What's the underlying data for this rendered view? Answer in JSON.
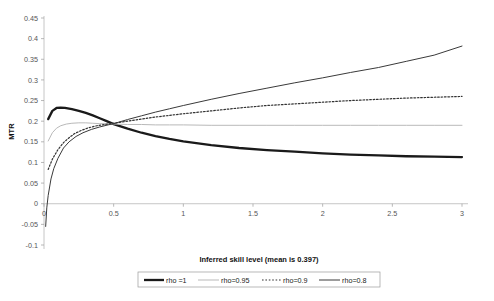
{
  "chart_data": {
    "type": "line",
    "title": "",
    "xlabel": "Inferred skill level (mean is 0.397)",
    "ylabel": "MTR",
    "xlim": [
      0,
      3
    ],
    "ylim": [
      -0.1,
      0.45
    ],
    "grid": false,
    "legend_position": "bottom",
    "xticks": [
      "0",
      "0.5",
      "1",
      "1.5",
      "2",
      "2.5",
      "3"
    ],
    "xtick_values": [
      0,
      0.5,
      1,
      1.5,
      2,
      2.5,
      3
    ],
    "yticks": [
      "-0.1",
      "-0.05",
      "0",
      "0.05",
      "0.1",
      "0.15",
      "0.2",
      "0.25",
      "0.3",
      "0.35",
      "0.4",
      "0.45"
    ],
    "ytick_values": [
      -0.1,
      -0.05,
      0,
      0.05,
      0.1,
      0.15,
      0.2,
      0.25,
      0.3,
      0.35,
      0.4,
      0.45
    ],
    "series": [
      {
        "name": "rho =1",
        "style": "thick-solid",
        "color": "#1a1a1a",
        "width": 2.3,
        "dash": "",
        "x": [
          0.03,
          0.06,
          0.09,
          0.12,
          0.15,
          0.2,
          0.25,
          0.3,
          0.35,
          0.4,
          0.45,
          0.5,
          0.6,
          0.7,
          0.8,
          0.9,
          1.0,
          1.2,
          1.4,
          1.6,
          1.8,
          2.0,
          2.2,
          2.4,
          2.6,
          2.8,
          3.0
        ],
        "y": [
          0.205,
          0.225,
          0.232,
          0.233,
          0.232,
          0.229,
          0.225,
          0.22,
          0.214,
          0.207,
          0.2,
          0.193,
          0.182,
          0.172,
          0.164,
          0.157,
          0.151,
          0.142,
          0.135,
          0.13,
          0.126,
          0.122,
          0.119,
          0.117,
          0.115,
          0.114,
          0.113
        ]
      },
      {
        "name": "rho=0.95",
        "style": "thin-solid-light",
        "color": "#b9b9b9",
        "width": 1.0,
        "dash": "",
        "x": [
          0.03,
          0.06,
          0.09,
          0.12,
          0.16,
          0.2,
          0.25,
          0.3,
          0.35,
          0.4,
          0.45,
          0.5,
          0.6,
          0.7,
          0.8,
          0.9,
          1.0,
          1.2,
          1.4,
          1.6,
          1.8,
          2.0,
          2.2,
          2.4,
          2.6,
          2.8,
          3.0
        ],
        "y": [
          0.152,
          0.172,
          0.183,
          0.189,
          0.193,
          0.195,
          0.196,
          0.196,
          0.195,
          0.194,
          0.194,
          0.193,
          0.192,
          0.192,
          0.191,
          0.191,
          0.191,
          0.19,
          0.19,
          0.19,
          0.19,
          0.19,
          0.19,
          0.19,
          0.19,
          0.19,
          0.19
        ]
      },
      {
        "name": "rho=0.9",
        "style": "dotted",
        "color": "#333333",
        "width": 1.2,
        "dash": "1.6 1.8",
        "x": [
          0.03,
          0.06,
          0.1,
          0.14,
          0.18,
          0.22,
          0.27,
          0.32,
          0.38,
          0.44,
          0.5,
          0.6,
          0.7,
          0.8,
          0.9,
          1.0,
          1.2,
          1.4,
          1.6,
          1.8,
          2.0,
          2.2,
          2.4,
          2.6,
          2.8,
          3.0
        ],
        "y": [
          0.083,
          0.108,
          0.131,
          0.148,
          0.16,
          0.17,
          0.178,
          0.184,
          0.189,
          0.192,
          0.195,
          0.2,
          0.205,
          0.21,
          0.214,
          0.218,
          0.225,
          0.232,
          0.238,
          0.242,
          0.246,
          0.25,
          0.253,
          0.256,
          0.258,
          0.26
        ]
      },
      {
        "name": "rho=0.8",
        "style": "thin-solid-dark",
        "color": "#3a3a3a",
        "width": 1.0,
        "dash": "",
        "x": [
          0.012,
          0.02,
          0.03,
          0.05,
          0.07,
          0.1,
          0.14,
          0.18,
          0.23,
          0.28,
          0.34,
          0.4,
          0.46,
          0.5,
          0.6,
          0.7,
          0.8,
          0.9,
          1.0,
          1.2,
          1.4,
          1.6,
          1.8,
          2.0,
          2.2,
          2.4,
          2.6,
          2.8,
          3.0
        ],
        "y": [
          -0.055,
          -0.01,
          0.02,
          0.06,
          0.085,
          0.11,
          0.135,
          0.15,
          0.163,
          0.172,
          0.18,
          0.186,
          0.191,
          0.194,
          0.204,
          0.213,
          0.222,
          0.23,
          0.238,
          0.253,
          0.267,
          0.28,
          0.293,
          0.305,
          0.318,
          0.33,
          0.345,
          0.36,
          0.382
        ]
      }
    ]
  },
  "legend": {
    "items": [
      {
        "label": "rho =1"
      },
      {
        "label": "rho=0.95"
      },
      {
        "label": "rho=0.9"
      },
      {
        "label": "rho=0.8"
      }
    ]
  }
}
